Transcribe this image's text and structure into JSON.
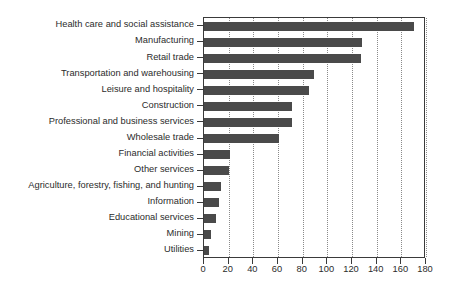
{
  "chart_data": {
    "type": "bar",
    "orientation": "horizontal",
    "title": "",
    "subtitle": "",
    "xlabel": "",
    "ylabel": "",
    "xlim": [
      0,
      180
    ],
    "ylim": null,
    "xticks": [
      0,
      20,
      40,
      60,
      80,
      100,
      120,
      140,
      160,
      180
    ],
    "xtick_labels": [
      "0",
      "20",
      "40",
      "60",
      "80",
      "100",
      "120",
      "140",
      "160",
      "180"
    ],
    "grid": "vertical-dotted",
    "legend": null,
    "legend_position": "none",
    "bar_color": "#4a4a4a",
    "axis_color": "#3a3a3a",
    "grid_color": "#8a8a8a",
    "text_color": "#2b2b2b",
    "background": "#ffffff",
    "categories": [
      "Health care and social assistance",
      "Manufacturing",
      "Retail trade",
      "Transportation and warehousing",
      "Leisure and hospitality",
      "Construction",
      "Professional and business services",
      "Wholesale trade",
      "Financial activities",
      "Other services",
      "Agriculture, forestry, fishing, and hunting",
      "Information",
      "Educational services",
      "Mining",
      "Utilities"
    ],
    "values": [
      170,
      128,
      127,
      89,
      85,
      71,
      71,
      61,
      21,
      20,
      14,
      12,
      10,
      6,
      4
    ]
  }
}
